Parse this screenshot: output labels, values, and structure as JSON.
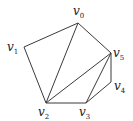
{
  "diagram": {
    "type": "graph",
    "vertices": [
      {
        "id": "v0",
        "label": "v",
        "sub": "0",
        "x": 78,
        "y": 23,
        "lx": 73,
        "ly": 15
      },
      {
        "id": "v1",
        "label": "v",
        "sub": "1",
        "x": 24,
        "y": 47,
        "lx": 7,
        "ly": 51
      },
      {
        "id": "v2",
        "label": "v",
        "sub": "2",
        "x": 46,
        "y": 103,
        "lx": 38,
        "ly": 116
      },
      {
        "id": "v3",
        "label": "v",
        "sub": "3",
        "x": 86,
        "y": 103,
        "lx": 79,
        "ly": 116
      },
      {
        "id": "v4",
        "label": "v",
        "sub": "4",
        "x": 111,
        "y": 82,
        "lx": 114,
        "ly": 90
      },
      {
        "id": "v5",
        "label": "v",
        "sub": "5",
        "x": 111,
        "y": 53,
        "lx": 113,
        "ly": 57
      }
    ],
    "edges": [
      [
        "v0",
        "v1"
      ],
      [
        "v1",
        "v2"
      ],
      [
        "v0",
        "v2"
      ],
      [
        "v0",
        "v5"
      ],
      [
        "v2",
        "v5"
      ],
      [
        "v2",
        "v3"
      ],
      [
        "v3",
        "v5"
      ],
      [
        "v3",
        "v4"
      ],
      [
        "v4",
        "v5"
      ]
    ],
    "edge_color": "#3a3a3a"
  }
}
